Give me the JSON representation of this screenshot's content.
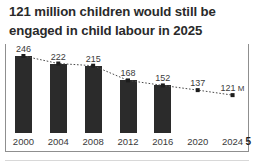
{
  "title": {
    "lines": [
      "121 million children would still be",
      "engaged in child labour in 2025"
    ],
    "full": "121 million children would still be engaged in child labour in 2025"
  },
  "footer": {
    "page_number": "5"
  },
  "colors": {
    "bar": "#2b2b2b",
    "marker": "#1d1d1d",
    "trend_line": "#4a4a4a",
    "frame": "#8f8f8f",
    "text": "#2a2a2a",
    "background": "#ffffff"
  },
  "chart_data": {
    "type": "bar",
    "title": "121 million children would still be engaged in child labour in 2025",
    "xlabel": "",
    "ylabel": "",
    "unit": "M",
    "unit_note": "121 M",
    "categories": [
      "2000",
      "2004",
      "2008",
      "2012",
      "2016",
      "2020",
      "2024"
    ],
    "values": [
      246,
      222,
      215,
      168,
      152,
      137,
      121
    ],
    "value_labels": [
      "246",
      "222",
      "215",
      "168",
      "152",
      "137",
      "121"
    ],
    "bars_drawn": [
      true,
      true,
      true,
      true,
      true,
      false,
      false
    ],
    "series": [
      {
        "name": "Children in child labour (millions)",
        "values": [
          246,
          222,
          215,
          168,
          152,
          137,
          121
        ],
        "style": "bar-with-dotted-trend"
      }
    ],
    "ylim": [
      0,
      246
    ],
    "grid": false,
    "legend": "none",
    "trend_line_style": "dotted",
    "markers": "square"
  }
}
